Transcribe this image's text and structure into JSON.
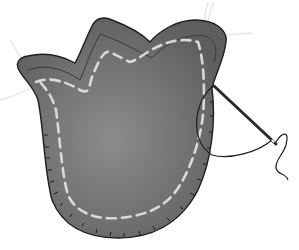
{
  "image": {
    "description": "Illustration of a grey felt tulip-shaped piece with white dashed running stitches, edge whip-stitching, stray white threads, and a sewing needle with black thread on the right.",
    "colors": {
      "felt": "#6e6e6e",
      "felt_light": "#8a8a8a",
      "felt_dark": "#555555",
      "outline": "#1e1e1e",
      "stitch": "#d9d9d9",
      "thread_white": "#e6e6e6",
      "needle": "#2a2a2a",
      "background": "#ffffff"
    }
  }
}
